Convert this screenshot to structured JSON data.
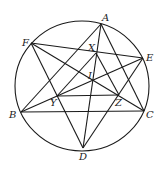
{
  "diagram": {
    "circle": {
      "cx": 82,
      "cy": 86,
      "rx": 67,
      "ry": 65
    },
    "points": [
      {
        "name": "A",
        "x": 101,
        "y": 24,
        "lx": 102,
        "ly": 21
      },
      {
        "name": "B",
        "x": 21,
        "y": 112,
        "lx": 9,
        "ly": 118
      },
      {
        "name": "C",
        "x": 144,
        "y": 111,
        "lx": 146,
        "ly": 118
      },
      {
        "name": "D",
        "x": 83,
        "y": 148,
        "lx": 79,
        "ly": 160
      },
      {
        "name": "E",
        "x": 143,
        "y": 58,
        "lx": 146,
        "ly": 61
      },
      {
        "name": "F",
        "x": 31,
        "y": 43,
        "lx": 22,
        "ly": 46
      },
      {
        "name": "X",
        "x": 96,
        "y": 53,
        "lx": 88,
        "ly": 51
      },
      {
        "name": "I",
        "x": 93,
        "y": 80,
        "lx": 88,
        "ly": 79
      },
      {
        "name": "Y",
        "x": 57,
        "y": 96,
        "lx": 50,
        "ly": 106
      },
      {
        "name": "Z",
        "x": 119,
        "y": 95,
        "lx": 115,
        "ly": 106
      }
    ],
    "segments": [
      [
        "A",
        "B"
      ],
      [
        "A",
        "C"
      ],
      [
        "A",
        "D"
      ],
      [
        "B",
        "C"
      ],
      [
        "B",
        "E"
      ],
      [
        "F",
        "E"
      ],
      [
        "F",
        "C"
      ],
      [
        "F",
        "D"
      ],
      [
        "E",
        "D"
      ],
      [
        "Y",
        "Z"
      ],
      [
        "X",
        "Y"
      ],
      [
        "X",
        "Z"
      ]
    ]
  }
}
